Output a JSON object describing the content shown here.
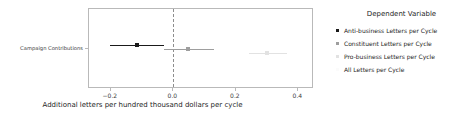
{
  "chart_data": {
    "type": "scatter",
    "title": "",
    "xlabel": "Additional letters per hundred thousand dollars per cycle",
    "ylabel": "",
    "xlim": [
      -0.27,
      0.45
    ],
    "xticks": [
      -0.2,
      0.0,
      0.2,
      0.4
    ],
    "xticklabels": [
      "−0.2",
      "0.0",
      "0.2",
      "0.4"
    ],
    "categories": [
      "Campaign Contributions"
    ],
    "grid": false,
    "reference_line": {
      "value": 0.0,
      "style": "dashed",
      "color": "#8d8d8d"
    },
    "legend": {
      "position": "right",
      "title": "Dependent Variable"
    },
    "series": [
      {
        "name": "Anti-business Letters per Cycle",
        "color": "#1a1a1a",
        "estimate": -0.118,
        "ci_low": -0.202,
        "ci_high": -0.031,
        "y_offset": 0.18
      },
      {
        "name": "Constituent Letters per Cycle",
        "color": "#9e9e9e",
        "estimate": 0.047,
        "ci_low": -0.031,
        "ci_high": 0.131,
        "y_offset": 0.0
      },
      {
        "name": "Pro-business Letters per Cycle",
        "color": "#e2e2e2",
        "estimate": 0.3,
        "ci_low": 0.243,
        "ci_high": 0.362,
        "y_offset": -0.18
      },
      {
        "name": "All Letters per Cycle",
        "color": "#fbfbfb",
        "estimate": null,
        "ci_low": null,
        "ci_high": null,
        "y_offset": -0.36
      }
    ]
  },
  "axis": {
    "xtitle": "Additional letters per hundred thousand dollars per cycle",
    "xticklabels": [
      "−0.2",
      "0.0",
      "0.2",
      "0.4"
    ],
    "ycategory": "Campaign Contributions"
  },
  "legend": {
    "title": "Dependent Variable",
    "items": [
      {
        "label": "Anti-business Letters per Cycle"
      },
      {
        "label": "Constituent Letters per Cycle"
      },
      {
        "label": "Pro-business Letters per Cycle"
      },
      {
        "label": "All Letters per Cycle"
      }
    ]
  }
}
